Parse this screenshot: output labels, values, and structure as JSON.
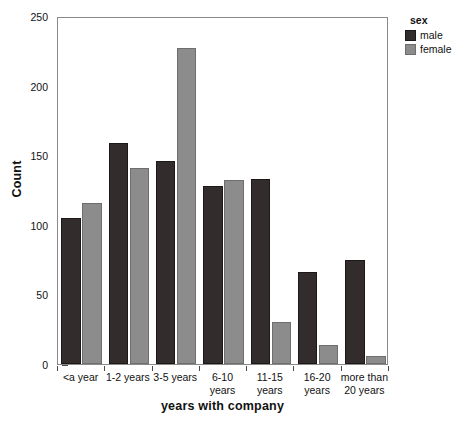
{
  "chart_data": {
    "type": "bar",
    "title": "",
    "xlabel": "years with company",
    "ylabel": "Count",
    "categories": [
      "<a year",
      "1-2 years",
      "3-5 years",
      "6-10 years",
      "11-15 years",
      "16-20 years",
      "more than 20 years"
    ],
    "series": [
      {
        "name": "male",
        "values": [
          105,
          159,
          146,
          128,
          133,
          66,
          75
        ]
      },
      {
        "name": "female",
        "values": [
          116,
          141,
          227,
          132,
          30,
          14,
          6
        ]
      }
    ],
    "ylim": [
      0,
      250
    ],
    "yticks": [
      0,
      50,
      100,
      150,
      200,
      250
    ],
    "ytick_labels": [
      "0",
      "50",
      "100",
      "150",
      "200",
      "250"
    ],
    "grid": false,
    "legend": {
      "title": "sex",
      "position": "right",
      "entries": [
        "male",
        "female"
      ]
    },
    "colors": {
      "male": "#332c2c",
      "female": "#8c8c8c",
      "frame": "#8a8a8a",
      "text": "#111111"
    }
  }
}
